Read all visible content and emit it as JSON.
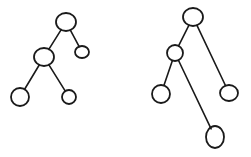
{
  "diagram": {
    "type": "tree",
    "stroke_color": "#1a1a1a",
    "background": "#ffffff",
    "trees": [
      {
        "name": "left-tree",
        "nodes": [
          {
            "id": "root",
            "cx": 66,
            "cy": 22,
            "rx": 10,
            "ry": 9
          },
          {
            "id": "r",
            "cx": 82,
            "cy": 52,
            "rx": 7,
            "ry": 6
          },
          {
            "id": "l",
            "cx": 44,
            "cy": 57,
            "rx": 10,
            "ry": 9
          },
          {
            "id": "ll",
            "cx": 20,
            "cy": 97,
            "rx": 9,
            "ry": 9
          },
          {
            "id": "lr",
            "cx": 69,
            "cy": 97,
            "rx": 7,
            "ry": 7
          }
        ],
        "edges": [
          [
            "root",
            "l"
          ],
          [
            "root",
            "r"
          ],
          [
            "l",
            "ll"
          ],
          [
            "l",
            "lr"
          ]
        ]
      },
      {
        "name": "right-tree",
        "nodes": [
          {
            "id": "root",
            "cx": 193,
            "cy": 17,
            "rx": 10,
            "ry": 9
          },
          {
            "id": "l",
            "cx": 175,
            "cy": 53,
            "rx": 8,
            "ry": 8
          },
          {
            "id": "r",
            "cx": 229,
            "cy": 93,
            "rx": 9,
            "ry": 8
          },
          {
            "id": "ll",
            "cx": 161,
            "cy": 94,
            "rx": 9,
            "ry": 9
          },
          {
            "id": "lr",
            "cx": 215,
            "cy": 137,
            "rx": 9,
            "ry": 11
          }
        ],
        "edges": [
          [
            "root",
            "l"
          ],
          [
            "root",
            "r"
          ],
          [
            "l",
            "ll"
          ],
          [
            "l",
            "lr"
          ]
        ]
      }
    ]
  }
}
